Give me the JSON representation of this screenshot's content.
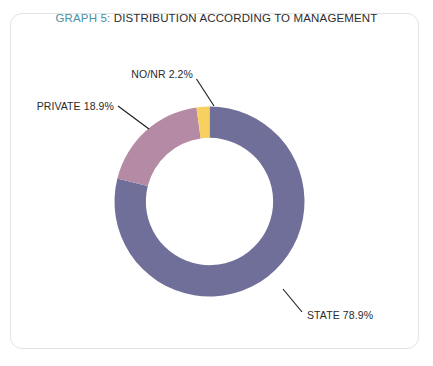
{
  "card": {
    "background": "#ffffff",
    "border_color": "#e2e2e2"
  },
  "title": {
    "prefix": "GRAPH 5:",
    "prefix_color": "#4d8fa3",
    "text": " DISTRIBUTION ACCORDING TO MANAGEMENT",
    "text_color": "#2e2e2e"
  },
  "chart_data": {
    "type": "pie",
    "variant": "donut",
    "title": "GRAPH 5: DISTRIBUTION ACCORDING TO MANAGEMENT",
    "xlabel": "",
    "ylabel": "",
    "grid": false,
    "legend": "none",
    "labels_position": "outside-with-leader-lines",
    "start_angle_deg": 0,
    "direction": "clockwise",
    "inner_radius_ratio": 0.67,
    "categories": [
      "STATE",
      "PRIVATE",
      "NO/NR"
    ],
    "values": [
      78.9,
      18.9,
      2.2
    ],
    "units": "%",
    "colors": [
      "#6f6f99",
      "#b58aa5",
      "#f7d060"
    ],
    "slices": [
      {
        "name": "STATE",
        "value": 78.9,
        "label": "STATE 78.9%",
        "color": "#6f6f99"
      },
      {
        "name": "PRIVATE",
        "value": 18.9,
        "label": "PRIVATE 18.9%",
        "color": "#b58aa5"
      },
      {
        "name": "NO/NR",
        "value": 2.2,
        "label": "NO/NR 2.2%",
        "color": "#f7d060"
      }
    ]
  }
}
